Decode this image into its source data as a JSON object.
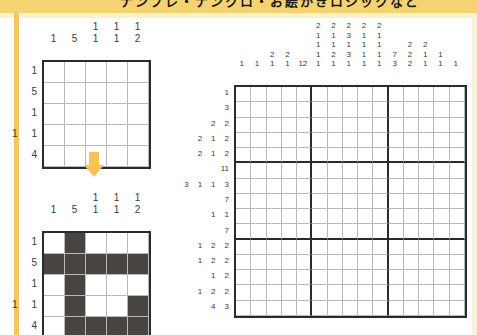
{
  "page": {
    "banner_text": "ナンプレ・ナンクロ・お絵かきロジックなど",
    "accent_band": "#f5d372",
    "accent_rail": "#f3c75c",
    "arrow_color": "#f6c454",
    "grid_line_light": "#b9b9b9",
    "grid_line_bold": "#2b2b2b",
    "filled_color": "#484541"
  },
  "puzzle_a": {
    "name": "example-blank-grid",
    "size": 5,
    "col_clues": [
      [
        "1"
      ],
      [
        "5"
      ],
      [
        "1",
        "1"
      ],
      [
        "1",
        "1"
      ],
      [
        "1",
        "2"
      ]
    ],
    "row_clues": [
      [
        "1"
      ],
      [
        "5"
      ],
      [
        "1"
      ],
      [
        "1",
        "1"
      ],
      [
        "4"
      ]
    ],
    "solution": [
      [
        0,
        0,
        0,
        0,
        0
      ],
      [
        0,
        0,
        0,
        0,
        0
      ],
      [
        0,
        0,
        0,
        0,
        0
      ],
      [
        0,
        0,
        0,
        0,
        0
      ],
      [
        0,
        0,
        0,
        0,
        0
      ]
    ]
  },
  "arrow": {
    "name": "down-arrow",
    "glyph": "▼"
  },
  "puzzle_b": {
    "name": "example-solved-grid",
    "size": 5,
    "col_clues": [
      [
        "1"
      ],
      [
        "5"
      ],
      [
        "1",
        "1"
      ],
      [
        "1",
        "1"
      ],
      [
        "1",
        "2"
      ]
    ],
    "row_clues": [
      [
        "1"
      ],
      [
        "5"
      ],
      [
        "1"
      ],
      [
        "1",
        "1"
      ],
      [
        "4"
      ]
    ],
    "solution": [
      [
        0,
        1,
        0,
        0,
        0
      ],
      [
        1,
        1,
        1,
        1,
        1
      ],
      [
        0,
        1,
        0,
        0,
        0
      ],
      [
        0,
        1,
        0,
        0,
        1
      ],
      [
        0,
        1,
        1,
        1,
        1
      ]
    ]
  },
  "puzzle_c": {
    "name": "main-puzzle-grid",
    "size": 15,
    "col_clues": [
      [
        "1"
      ],
      [
        "1"
      ],
      [
        "2",
        "1"
      ],
      [
        "2",
        "1"
      ],
      [
        "12"
      ],
      [
        "2",
        "1",
        "1",
        "1",
        "1"
      ],
      [
        "2",
        "1",
        "1",
        "2",
        "1"
      ],
      [
        "2",
        "3",
        "1",
        "3",
        "1"
      ],
      [
        "2",
        "1",
        "1",
        "1",
        "1"
      ],
      [
        "2",
        "1",
        "1",
        "1",
        "1"
      ],
      [
        "7",
        "3"
      ],
      [
        "2",
        "2",
        "2"
      ],
      [
        "2",
        "1",
        "1"
      ],
      [
        "1",
        "1"
      ],
      [
        "1"
      ]
    ],
    "row_clues": [
      [
        "1"
      ],
      [
        "3"
      ],
      [
        "2",
        "2"
      ],
      [
        "2",
        "1",
        "2"
      ],
      [
        "2",
        "1",
        "2"
      ],
      [
        "11"
      ],
      [
        "3",
        "1",
        "1",
        "3"
      ],
      [
        "7"
      ],
      [
        "1",
        "1"
      ],
      [
        "7"
      ],
      [
        "1",
        "2",
        "2"
      ],
      [
        "1",
        "2",
        "2"
      ],
      [
        "1",
        "2"
      ],
      [
        "1",
        "2",
        "2"
      ],
      [
        "4",
        "3"
      ]
    ],
    "solution": [
      [
        0,
        0,
        0,
        0,
        0,
        0,
        0,
        0,
        0,
        0,
        0,
        0,
        0,
        0,
        0
      ],
      [
        0,
        0,
        0,
        0,
        0,
        0,
        0,
        0,
        0,
        0,
        0,
        0,
        0,
        0,
        0
      ],
      [
        0,
        0,
        0,
        0,
        0,
        0,
        0,
        0,
        0,
        0,
        0,
        0,
        0,
        0,
        0
      ],
      [
        0,
        0,
        0,
        0,
        0,
        0,
        0,
        0,
        0,
        0,
        0,
        0,
        0,
        0,
        0
      ],
      [
        0,
        0,
        0,
        0,
        0,
        0,
        0,
        0,
        0,
        0,
        0,
        0,
        0,
        0,
        0
      ],
      [
        0,
        0,
        0,
        0,
        0,
        0,
        0,
        0,
        0,
        0,
        0,
        0,
        0,
        0,
        0
      ],
      [
        0,
        0,
        0,
        0,
        0,
        0,
        0,
        0,
        0,
        0,
        0,
        0,
        0,
        0,
        0
      ],
      [
        0,
        0,
        0,
        0,
        0,
        0,
        0,
        0,
        0,
        0,
        0,
        0,
        0,
        0,
        0
      ],
      [
        0,
        0,
        0,
        0,
        0,
        0,
        0,
        0,
        0,
        0,
        0,
        0,
        0,
        0,
        0
      ],
      [
        0,
        0,
        0,
        0,
        0,
        0,
        0,
        0,
        0,
        0,
        0,
        0,
        0,
        0,
        0
      ],
      [
        0,
        0,
        0,
        0,
        0,
        0,
        0,
        0,
        0,
        0,
        0,
        0,
        0,
        0,
        0
      ],
      [
        0,
        0,
        0,
        0,
        0,
        0,
        0,
        0,
        0,
        0,
        0,
        0,
        0,
        0,
        0
      ],
      [
        0,
        0,
        0,
        0,
        0,
        0,
        0,
        0,
        0,
        0,
        0,
        0,
        0,
        0,
        0
      ],
      [
        0,
        0,
        0,
        0,
        0,
        0,
        0,
        0,
        0,
        0,
        0,
        0,
        0,
        0,
        0
      ],
      [
        0,
        0,
        0,
        0,
        0,
        0,
        0,
        0,
        0,
        0,
        0,
        0,
        0,
        0,
        0
      ]
    ]
  }
}
